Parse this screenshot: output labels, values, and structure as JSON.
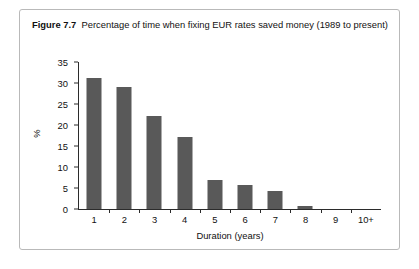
{
  "figure": {
    "label": "Figure 7.7",
    "caption": "Percentage of time when fixing EUR rates saved money (1989 to present)"
  },
  "chart_data": {
    "type": "bar",
    "title": "Percentage of time when fixing EUR rates saved money (1989 to present)",
    "xlabel": "Duration (years)",
    "ylabel": "%",
    "categories": [
      "1",
      "2",
      "3",
      "4",
      "5",
      "6",
      "7",
      "8",
      "9",
      "10+"
    ],
    "values": [
      31.2,
      29.0,
      22.2,
      17.2,
      7.0,
      5.7,
      4.2,
      0.8,
      0,
      0
    ],
    "ylim": [
      0,
      35
    ],
    "yticks": [
      0,
      5,
      10,
      15,
      20,
      25,
      30,
      35
    ],
    "grid": false,
    "legend": false,
    "bar_color": "#595959",
    "axis_color": "#2b2b2b"
  }
}
